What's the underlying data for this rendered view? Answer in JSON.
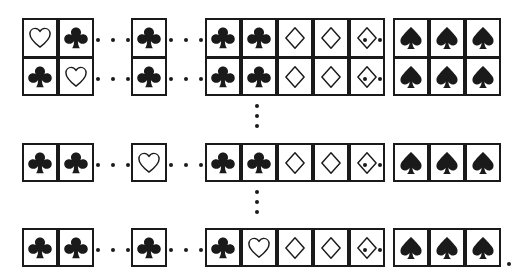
{
  "figure": {
    "name": "card-grid-figure",
    "width": 521,
    "height": 277,
    "ink_color": "#1a1a1a",
    "background_color": "#ffffff",
    "suit_glyphs": {
      "heart": "heart-outline-icon",
      "club": "club-filled-icon",
      "diamond": "diamond-outline-icon",
      "spade": "spade-filled-icon"
    },
    "ellipsis": {
      "horizontal_label": "...",
      "vertical_label": "⋮",
      "dot_count": 3
    },
    "trailing_punctuation": "."
  },
  "rows": [
    {
      "id": "row-1",
      "y": 18,
      "stacked_with_next": true,
      "items": [
        {
          "kind": "card",
          "suit": "heart",
          "x": 22
        },
        {
          "kind": "card",
          "suit": "club",
          "x": 58
        },
        {
          "kind": "hdots",
          "x": 96,
          "width": 34
        },
        {
          "kind": "card",
          "suit": "club",
          "x": 131
        },
        {
          "kind": "hdots",
          "x": 169,
          "width": 34
        },
        {
          "kind": "card",
          "suit": "club",
          "x": 205
        },
        {
          "kind": "card",
          "suit": "club",
          "x": 241
        },
        {
          "kind": "card",
          "suit": "diamond",
          "x": 277
        },
        {
          "kind": "card",
          "suit": "diamond",
          "x": 313
        },
        {
          "kind": "card",
          "suit": "diamond",
          "x": 349
        },
        {
          "kind": "hdots",
          "x": 363,
          "width": 34,
          "offset": true
        },
        {
          "kind": "card",
          "suit": "spade",
          "x": 393
        },
        {
          "kind": "card",
          "suit": "spade",
          "x": 429
        },
        {
          "kind": "card",
          "suit": "spade",
          "x": 465
        }
      ]
    },
    {
      "id": "row-2",
      "y": 57,
      "stacked_with_next": false,
      "items": [
        {
          "kind": "card",
          "suit": "club",
          "x": 22
        },
        {
          "kind": "card",
          "suit": "heart",
          "x": 58
        },
        {
          "kind": "hdots",
          "x": 96,
          "width": 34
        },
        {
          "kind": "card",
          "suit": "club",
          "x": 131
        },
        {
          "kind": "hdots",
          "x": 169,
          "width": 34
        },
        {
          "kind": "card",
          "suit": "club",
          "x": 205
        },
        {
          "kind": "card",
          "suit": "club",
          "x": 241
        },
        {
          "kind": "card",
          "suit": "diamond",
          "x": 277
        },
        {
          "kind": "card",
          "suit": "diamond",
          "x": 313
        },
        {
          "kind": "card",
          "suit": "diamond",
          "x": 349
        },
        {
          "kind": "hdots",
          "x": 363,
          "width": 34,
          "offset": true
        },
        {
          "kind": "card",
          "suit": "spade",
          "x": 393
        },
        {
          "kind": "card",
          "suit": "spade",
          "x": 429
        },
        {
          "kind": "card",
          "suit": "spade",
          "x": 465
        }
      ]
    },
    {
      "id": "row-3",
      "y": 143,
      "stacked_with_next": false,
      "items": [
        {
          "kind": "card",
          "suit": "club",
          "x": 22
        },
        {
          "kind": "card",
          "suit": "club",
          "x": 58
        },
        {
          "kind": "hdots",
          "x": 96,
          "width": 34
        },
        {
          "kind": "card",
          "suit": "heart",
          "x": 131
        },
        {
          "kind": "hdots",
          "x": 169,
          "width": 34
        },
        {
          "kind": "card",
          "suit": "club",
          "x": 205
        },
        {
          "kind": "card",
          "suit": "club",
          "x": 241
        },
        {
          "kind": "card",
          "suit": "diamond",
          "x": 277
        },
        {
          "kind": "card",
          "suit": "diamond",
          "x": 313
        },
        {
          "kind": "card",
          "suit": "diamond",
          "x": 349
        },
        {
          "kind": "hdots",
          "x": 363,
          "width": 34,
          "offset": true
        },
        {
          "kind": "card",
          "suit": "spade",
          "x": 393
        },
        {
          "kind": "card",
          "suit": "spade",
          "x": 429
        },
        {
          "kind": "card",
          "suit": "spade",
          "x": 465
        }
      ]
    },
    {
      "id": "row-4",
      "y": 228,
      "stacked_with_next": false,
      "items": [
        {
          "kind": "card",
          "suit": "club",
          "x": 22
        },
        {
          "kind": "card",
          "suit": "club",
          "x": 58
        },
        {
          "kind": "hdots",
          "x": 96,
          "width": 34
        },
        {
          "kind": "card",
          "suit": "club",
          "x": 131
        },
        {
          "kind": "hdots",
          "x": 169,
          "width": 34
        },
        {
          "kind": "card",
          "suit": "club",
          "x": 205
        },
        {
          "kind": "card",
          "suit": "heart",
          "x": 241
        },
        {
          "kind": "card",
          "suit": "diamond",
          "x": 277
        },
        {
          "kind": "card",
          "suit": "diamond",
          "x": 313
        },
        {
          "kind": "card",
          "suit": "diamond",
          "x": 349
        },
        {
          "kind": "hdots",
          "x": 363,
          "width": 34,
          "offset": true
        },
        {
          "kind": "card",
          "suit": "spade",
          "x": 393
        },
        {
          "kind": "card",
          "suit": "spade",
          "x": 429
        },
        {
          "kind": "card",
          "suit": "spade",
          "x": 465
        }
      ]
    }
  ],
  "vertical_ellipses": [
    {
      "id": "vdots-1",
      "x": 254,
      "y": 104,
      "height": 24
    },
    {
      "id": "vdots-2",
      "x": 254,
      "y": 190,
      "height": 24
    }
  ],
  "trailing_period": {
    "id": "row-4-period",
    "x": 507,
    "y": 262
  }
}
